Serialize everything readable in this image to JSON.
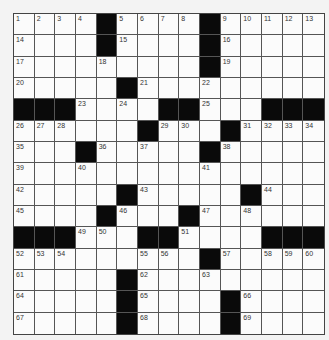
{
  "puzzle": {
    "rows": 15,
    "cols": 15,
    "black_cells": [
      [
        0,
        4
      ],
      [
        0,
        9
      ],
      [
        1,
        4
      ],
      [
        1,
        9
      ],
      [
        2,
        9
      ],
      [
        3,
        5
      ],
      [
        4,
        0
      ],
      [
        4,
        1
      ],
      [
        4,
        2
      ],
      [
        4,
        7
      ],
      [
        4,
        8
      ],
      [
        4,
        12
      ],
      [
        4,
        13
      ],
      [
        4,
        14
      ],
      [
        5,
        6
      ],
      [
        5,
        10
      ],
      [
        6,
        3
      ],
      [
        6,
        9
      ],
      [
        8,
        5
      ],
      [
        8,
        11
      ],
      [
        9,
        4
      ],
      [
        9,
        8
      ],
      [
        10,
        0
      ],
      [
        10,
        1
      ],
      [
        10,
        2
      ],
      [
        10,
        6
      ],
      [
        10,
        7
      ],
      [
        10,
        12
      ],
      [
        10,
        13
      ],
      [
        10,
        14
      ],
      [
        11,
        9
      ],
      [
        12,
        5
      ],
      [
        13,
        5
      ],
      [
        13,
        10
      ],
      [
        14,
        5
      ],
      [
        14,
        10
      ]
    ],
    "numbered_cells": [
      {
        "r": 0,
        "c": 0,
        "n": "1"
      },
      {
        "r": 0,
        "c": 1,
        "n": "2"
      },
      {
        "r": 0,
        "c": 2,
        "n": "3"
      },
      {
        "r": 0,
        "c": 3,
        "n": "4"
      },
      {
        "r": 0,
        "c": 5,
        "n": "5"
      },
      {
        "r": 0,
        "c": 6,
        "n": "6"
      },
      {
        "r": 0,
        "c": 7,
        "n": "7"
      },
      {
        "r": 0,
        "c": 8,
        "n": "8"
      },
      {
        "r": 0,
        "c": 10,
        "n": "9"
      },
      {
        "r": 0,
        "c": 11,
        "n": "10"
      },
      {
        "r": 0,
        "c": 12,
        "n": "11"
      },
      {
        "r": 0,
        "c": 13,
        "n": "12"
      },
      {
        "r": 0,
        "c": 14,
        "n": "13"
      },
      {
        "r": 1,
        "c": 0,
        "n": "14"
      },
      {
        "r": 1,
        "c": 5,
        "n": "15"
      },
      {
        "r": 1,
        "c": 10,
        "n": "16"
      },
      {
        "r": 2,
        "c": 0,
        "n": "17"
      },
      {
        "r": 2,
        "c": 4,
        "n": "18"
      },
      {
        "r": 2,
        "c": 10,
        "n": "19"
      },
      {
        "r": 3,
        "c": 0,
        "n": "20"
      },
      {
        "r": 3,
        "c": 6,
        "n": "21"
      },
      {
        "r": 3,
        "c": 9,
        "n": "22"
      },
      {
        "r": 4,
        "c": 3,
        "n": "23"
      },
      {
        "r": 4,
        "c": 5,
        "n": "24"
      },
      {
        "r": 4,
        "c": 9,
        "n": "25"
      },
      {
        "r": 5,
        "c": 0,
        "n": "26"
      },
      {
        "r": 5,
        "c": 1,
        "n": "27"
      },
      {
        "r": 5,
        "c": 2,
        "n": "28"
      },
      {
        "r": 5,
        "c": 7,
        "n": "29"
      },
      {
        "r": 5,
        "c": 8,
        "n": "30"
      },
      {
        "r": 5,
        "c": 11,
        "n": "31"
      },
      {
        "r": 5,
        "c": 12,
        "n": "32"
      },
      {
        "r": 5,
        "c": 13,
        "n": "33"
      },
      {
        "r": 5,
        "c": 14,
        "n": "34"
      },
      {
        "r": 6,
        "c": 0,
        "n": "35"
      },
      {
        "r": 6,
        "c": 4,
        "n": "36"
      },
      {
        "r": 6,
        "c": 6,
        "n": "37"
      },
      {
        "r": 6,
        "c": 10,
        "n": "38"
      },
      {
        "r": 7,
        "c": 0,
        "n": "39"
      },
      {
        "r": 7,
        "c": 3,
        "n": "40"
      },
      {
        "r": 7,
        "c": 9,
        "n": "41"
      },
      {
        "r": 8,
        "c": 0,
        "n": "42"
      },
      {
        "r": 8,
        "c": 6,
        "n": "43"
      },
      {
        "r": 8,
        "c": 12,
        "n": "44"
      },
      {
        "r": 9,
        "c": 0,
        "n": "45"
      },
      {
        "r": 9,
        "c": 5,
        "n": "46"
      },
      {
        "r": 9,
        "c": 9,
        "n": "47"
      },
      {
        "r": 9,
        "c": 11,
        "n": "48"
      },
      {
        "r": 10,
        "c": 3,
        "n": "49"
      },
      {
        "r": 10,
        "c": 4,
        "n": "50"
      },
      {
        "r": 10,
        "c": 8,
        "n": "51"
      },
      {
        "r": 11,
        "c": 0,
        "n": "52"
      },
      {
        "r": 11,
        "c": 1,
        "n": "53"
      },
      {
        "r": 11,
        "c": 2,
        "n": "54"
      },
      {
        "r": 11,
        "c": 6,
        "n": "55"
      },
      {
        "r": 11,
        "c": 7,
        "n": "56"
      },
      {
        "r": 11,
        "c": 10,
        "n": "57"
      },
      {
        "r": 11,
        "c": 12,
        "n": "58"
      },
      {
        "r": 11,
        "c": 13,
        "n": "59"
      },
      {
        "r": 11,
        "c": 14,
        "n": "60"
      },
      {
        "r": 12,
        "c": 0,
        "n": "61"
      },
      {
        "r": 12,
        "c": 6,
        "n": "62"
      },
      {
        "r": 12,
        "c": 9,
        "n": "63"
      },
      {
        "r": 13,
        "c": 0,
        "n": "64"
      },
      {
        "r": 13,
        "c": 6,
        "n": "65"
      },
      {
        "r": 13,
        "c": 11,
        "n": "66"
      },
      {
        "r": 14,
        "c": 0,
        "n": "67"
      },
      {
        "r": 14,
        "c": 6,
        "n": "68"
      },
      {
        "r": 14,
        "c": 11,
        "n": "69"
      }
    ]
  },
  "colors": {
    "background": "#f3f3f3",
    "cell": "#fbfbfb",
    "block": "#0a0a0a",
    "grid_line": "#555555"
  }
}
